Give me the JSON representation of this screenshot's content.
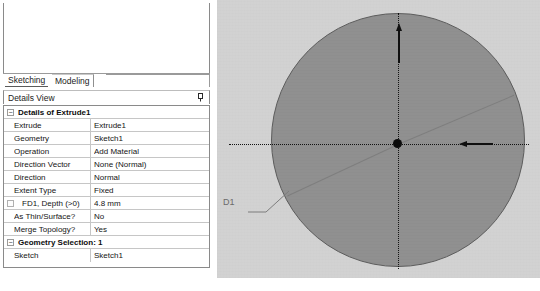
{
  "app": {
    "panel_title": "Details View",
    "pin_icon": "pin-icon"
  },
  "tabs": [
    {
      "label": "Sketching",
      "active": true
    },
    {
      "label": "Modeling",
      "active": false
    }
  ],
  "details": {
    "groups": [
      {
        "header": "Details of Extrude1",
        "expander": "−",
        "rows": [
          {
            "name": "Extrude",
            "value": "Extrude1",
            "indent": false,
            "checkbox": false
          },
          {
            "name": "Geometry",
            "value": "Sketch1",
            "indent": false,
            "checkbox": false
          },
          {
            "name": "Operation",
            "value": "Add Material",
            "indent": false,
            "checkbox": false
          },
          {
            "name": "Direction Vector",
            "value": "None (Normal)",
            "indent": false,
            "checkbox": false
          },
          {
            "name": "Direction",
            "value": "Normal",
            "indent": false,
            "checkbox": false
          },
          {
            "name": "Extent Type",
            "value": "Fixed",
            "indent": false,
            "checkbox": false
          },
          {
            "name": "FD1,  Depth (>0)",
            "value": "4.8 mm",
            "indent": true,
            "checkbox": true
          },
          {
            "name": "As Thin/Surface?",
            "value": "No",
            "indent": false,
            "checkbox": false
          },
          {
            "name": "Merge Topology?",
            "value": "Yes",
            "indent": false,
            "checkbox": false
          }
        ]
      },
      {
        "header": "Geometry Selection: 1",
        "expander": "−",
        "rows": [
          {
            "name": "Sketch",
            "value": "Sketch1",
            "indent": false,
            "checkbox": false
          }
        ]
      }
    ]
  },
  "viewport": {
    "dimension_label": "D1",
    "origin_marker": "origin-dot",
    "colors": {
      "background": "#d2d2d2",
      "disc_fill": "#8f8f8f",
      "disc_edge": "#5c5c5c",
      "axis": "#121212",
      "label": "#6b6b6b"
    }
  },
  "caption": {
    "text": ""
  }
}
